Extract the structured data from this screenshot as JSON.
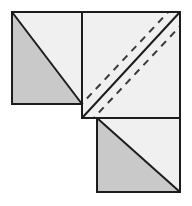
{
  "figure": {
    "canvas": {
      "width": 192,
      "height": 206,
      "background": "#ffffff"
    },
    "style": {
      "shaded_fill": "#c9c9c9",
      "light_fill": "#f0f0f0",
      "outline_color": "#1c1c1c",
      "outline_width": 2,
      "diagonal_color": "#1c1c1c",
      "diagonal_width": 2,
      "dashed_color": "#3a3a3a",
      "dashed_width": 2,
      "dash_pattern": "7 6"
    },
    "shapes": [
      {
        "id": "top-left-square",
        "label": "Top-left square",
        "x": 12,
        "y": 12,
        "width": 70,
        "height": 92,
        "diagonal": "top-left-to-bottom-right",
        "shaded_half": "lower-left",
        "shaded_points": "12,12 12,104 82,104",
        "light_points": "12,12 82,104 82,12",
        "dashed_lines": 0
      },
      {
        "id": "center-square",
        "label": "Large center square with cut lines",
        "x": 82,
        "y": 12,
        "width": 98,
        "height": 106,
        "diagonal": "bottom-left-to-top-right",
        "shaded_half": "none",
        "light_points": "82,12 180,12 180,118 82,118",
        "dashed_lines": 2
      },
      {
        "id": "bottom-right-square",
        "label": "Bottom-right square",
        "x": 97,
        "y": 118,
        "width": 83,
        "height": 74,
        "diagonal": "top-left-to-bottom-right",
        "shaded_half": "lower-left",
        "shaded_points": "97,118 97,192 180,192",
        "light_points": "97,118 180,192 180,118",
        "dashed_lines": 0
      }
    ],
    "lines": {
      "solid_diagonals": [
        {
          "id": "tl-diagonal",
          "x1": 12,
          "y1": 12,
          "x2": 82,
          "y2": 104
        },
        {
          "id": "center-diagonal",
          "x1": 82,
          "y1": 118,
          "x2": 180,
          "y2": 12
        },
        {
          "id": "br-diagonal",
          "x1": 97,
          "y1": 118,
          "x2": 180,
          "y2": 192
        }
      ],
      "dashed_diagonals": [
        {
          "id": "dashed-upper-left",
          "x1": 82,
          "y1": 104,
          "x2": 168,
          "y2": 12
        },
        {
          "id": "dashed-lower-right",
          "x1": 94,
          "y1": 118,
          "x2": 180,
          "y2": 26
        }
      ]
    }
  }
}
